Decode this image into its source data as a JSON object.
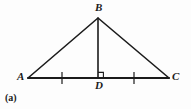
{
  "figure": {
    "caption": "(a)",
    "background_color": "#fdfdfd",
    "stroke_color": "#1b1b1b",
    "vertices": [
      {
        "name": "A",
        "label": "A",
        "x": 28,
        "y": 78
      },
      {
        "name": "B",
        "label": "B",
        "x": 98,
        "y": 18
      },
      {
        "name": "C",
        "label": "C",
        "x": 169,
        "y": 78
      },
      {
        "name": "D",
        "label": "D",
        "x": 98,
        "y": 78
      }
    ],
    "segments": [
      {
        "name": "segment-AB",
        "from": "A",
        "to": "B",
        "x1": 28,
        "y1": 78,
        "x2": 98,
        "y2": 18,
        "width": 1.6
      },
      {
        "name": "segment-BC",
        "from": "B",
        "to": "C",
        "x1": 98,
        "y1": 18,
        "x2": 169,
        "y2": 78,
        "width": 1.6
      },
      {
        "name": "segment-AC",
        "from": "A",
        "to": "C",
        "x1": 28,
        "y1": 78,
        "x2": 169,
        "y2": 78,
        "width": 2.0
      },
      {
        "name": "segment-BD",
        "from": "B",
        "to": "D",
        "x1": 98,
        "y1": 18,
        "x2": 98,
        "y2": 78,
        "width": 1.6
      }
    ],
    "tick_marks": [
      {
        "name": "tick-AD",
        "on_segment": "segment-AD",
        "x": 62,
        "y1": 72,
        "y2": 84
      },
      {
        "name": "tick-DC",
        "on_segment": "segment-DC",
        "x": 134,
        "y1": 72,
        "y2": 84
      }
    ],
    "right_angle": {
      "name": "right-angle-at-D",
      "at_vertex": "D",
      "x": 98,
      "y": 78,
      "size": 6
    }
  }
}
